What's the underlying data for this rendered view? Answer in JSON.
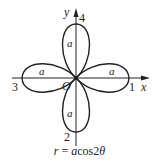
{
  "diagram": {
    "type": "polar-curve",
    "equation": "r = acos2θ",
    "caption": {
      "r": "r",
      "eq": " = ",
      "a": "a",
      "cos": "cos",
      "two": "2",
      "theta": "θ"
    },
    "axes": {
      "x_label": "x",
      "y_label": "y",
      "origin_label": "O"
    },
    "petal_numbers": {
      "right": "1",
      "bottom": "2",
      "left": "3",
      "top": "4"
    },
    "petal_length_labels": {
      "top": "a",
      "left": "a",
      "right": "a",
      "bottom": "a"
    },
    "colors": {
      "stroke": "#222222",
      "background": "#ffffff"
    }
  }
}
